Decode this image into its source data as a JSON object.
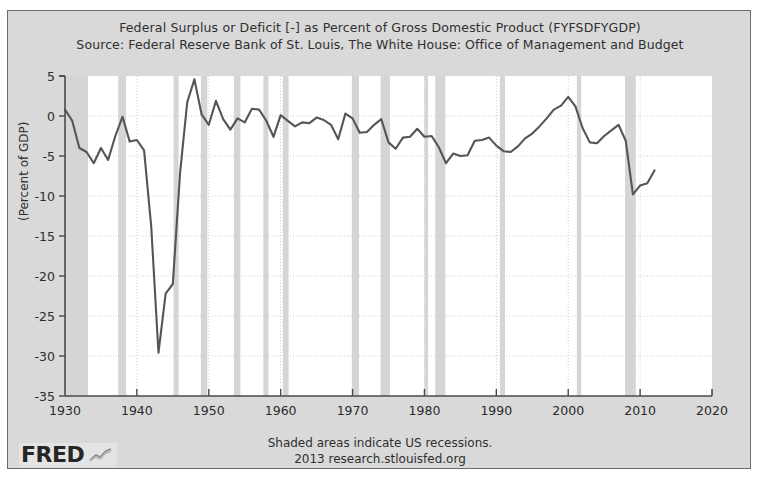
{
  "chart_data": {
    "type": "line",
    "title": "Federal Surplus or Deficit [-] as Percent of Gross Domestic Product (FYFSDFYGDP)",
    "subtitle": "Source: Federal Reserve Bank of St. Louis, The White House: Office of Management and Budget",
    "xlabel": "",
    "ylabel": "(Percent of GDP)",
    "xlim": [
      1930,
      2020
    ],
    "ylim": [
      -35,
      5
    ],
    "xticks": [
      1930,
      1940,
      1950,
      1960,
      1970,
      1980,
      1990,
      2000,
      2010,
      2020
    ],
    "yticks": [
      5,
      0,
      -5,
      -10,
      -15,
      -20,
      -25,
      -30,
      -35
    ],
    "grid": true,
    "legend": "none",
    "line_color": "#555555",
    "series": [
      {
        "name": "Federal Surplus or Deficit as Percent of GDP",
        "x": [
          1930,
          1931,
          1932,
          1933,
          1934,
          1935,
          1936,
          1937,
          1938,
          1939,
          1940,
          1941,
          1942,
          1943,
          1944,
          1945,
          1946,
          1947,
          1948,
          1949,
          1950,
          1951,
          1952,
          1953,
          1954,
          1955,
          1956,
          1957,
          1958,
          1959,
          1960,
          1961,
          1962,
          1963,
          1964,
          1965,
          1966,
          1967,
          1968,
          1969,
          1970,
          1971,
          1972,
          1973,
          1974,
          1975,
          1976,
          1977,
          1978,
          1979,
          1980,
          1981,
          1982,
          1983,
          1984,
          1985,
          1986,
          1987,
          1988,
          1989,
          1990,
          1991,
          1992,
          1993,
          1994,
          1995,
          1996,
          1997,
          1998,
          1999,
          2000,
          2001,
          2002,
          2003,
          2004,
          2005,
          2006,
          2007,
          2008,
          2009,
          2010,
          2011,
          2012
        ],
        "values": [
          0.8,
          -0.6,
          -4.0,
          -4.5,
          -5.9,
          -4.0,
          -5.5,
          -2.5,
          -0.1,
          -3.2,
          -3.0,
          -4.3,
          -13.9,
          -29.6,
          -22.2,
          -21.0,
          -7.2,
          1.7,
          4.6,
          0.2,
          -1.1,
          1.9,
          -0.4,
          -1.7,
          -0.3,
          -0.8,
          0.9,
          0.8,
          -0.6,
          -2.6,
          0.1,
          -0.6,
          -1.3,
          -0.8,
          -0.9,
          -0.2,
          -0.5,
          -1.1,
          -2.9,
          0.3,
          -0.3,
          -2.1,
          -2.0,
          -1.1,
          -0.4,
          -3.3,
          -4.1,
          -2.7,
          -2.6,
          -1.6,
          -2.6,
          -2.5,
          -3.9,
          -5.9,
          -4.7,
          -5.0,
          -4.9,
          -3.1,
          -3.0,
          -2.7,
          -3.7,
          -4.4,
          -4.5,
          -3.8,
          -2.8,
          -2.2,
          -1.3,
          -0.3,
          0.8,
          1.3,
          2.4,
          1.2,
          -1.5,
          -3.3,
          -3.4,
          -2.5,
          -1.8,
          -1.1,
          -3.1,
          -9.8,
          -8.7,
          -8.4,
          -6.8
        ]
      }
    ],
    "recessions": [
      {
        "start": 1929.6,
        "end": 1933.2
      },
      {
        "start": 1937.4,
        "end": 1938.5
      },
      {
        "start": 1945.1,
        "end": 1945.8
      },
      {
        "start": 1948.9,
        "end": 1949.8
      },
      {
        "start": 1953.5,
        "end": 1954.4
      },
      {
        "start": 1957.6,
        "end": 1958.3
      },
      {
        "start": 1960.3,
        "end": 1961.1
      },
      {
        "start": 1969.9,
        "end": 1970.9
      },
      {
        "start": 1973.9,
        "end": 1975.2
      },
      {
        "start": 1980.0,
        "end": 1980.5
      },
      {
        "start": 1981.5,
        "end": 1982.9
      },
      {
        "start": 1990.5,
        "end": 1991.2
      },
      {
        "start": 2001.2,
        "end": 2001.8
      },
      {
        "start": 2007.9,
        "end": 2009.4
      }
    ],
    "note": "Shaded areas indicate US recessions."
  },
  "footer": {
    "line1": "Shaded areas indicate US recessions.",
    "line2": "2013 research.stlouisfed.org"
  },
  "logo": {
    "word": "FRED",
    "glyph_name": "line-chart-glyph"
  },
  "colors": {
    "page_background": "#ffffff",
    "panel_background": "#d9d9d9",
    "plot_background": "#ffffff",
    "recession_band": "#d5d5d5",
    "line": "#555555",
    "axis": "#4a4a4a",
    "grid": "#d0d0d0",
    "text": "#2f2f2f"
  }
}
